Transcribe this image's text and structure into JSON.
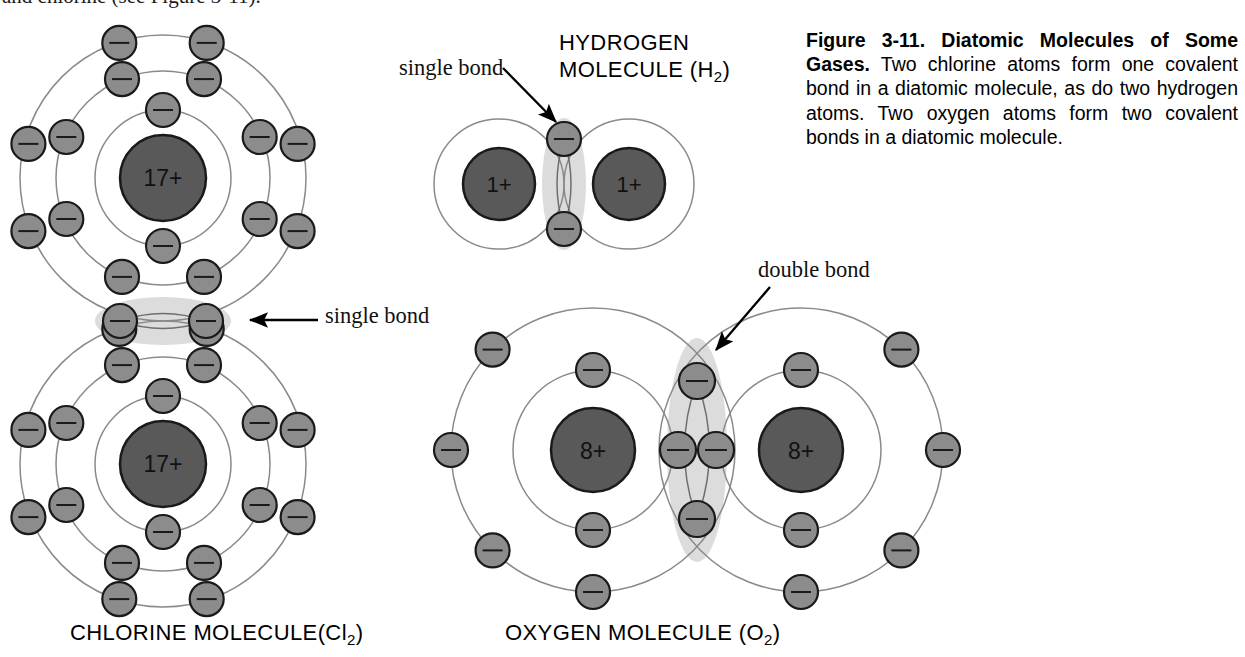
{
  "page": {
    "cropped_top_line": "and chlorine (see Figure 3-11).",
    "background": "#ffffff"
  },
  "caption": {
    "bold_lead": "Figure 3-11. Diatomic Molecules of Some Gases.",
    "body": " Two chlorine atoms form one covalent bond in a diatomic molecule, as do two hydrogen atoms. Two oxygen atoms form two covalent bonds in a diatomic molecule."
  },
  "colors": {
    "nucleus_fill": "#595959",
    "nucleus_stroke": "#1a1a1a",
    "electron_fill": "#8c8c8c",
    "electron_stroke": "#1a1a1a",
    "shell_stroke": "#8a8a8a",
    "bond_highlight": "#d9d9d9",
    "text": "#000000"
  },
  "molecules": [
    {
      "id": "chlorine",
      "title": "CHLORINE MOLECULE(Cl",
      "title_sub": "2",
      "title_tail": ")",
      "formula": "Cl2",
      "nucleus_label": "17+",
      "atom_count": 2,
      "orientation": "vertical",
      "shells": [
        2,
        8,
        7
      ],
      "bond_label": "single bond",
      "bond_type": "single",
      "shared_electrons": 2
    },
    {
      "id": "hydrogen",
      "title_line1": "HYDROGEN",
      "title_line2": "MOLECULE (H",
      "title_sub": "2",
      "title_tail": ")",
      "formula": "H2",
      "nucleus_label": "1+",
      "atom_count": 2,
      "orientation": "horizontal",
      "shells": [
        1
      ],
      "bond_label": "single bond",
      "bond_type": "single",
      "shared_electrons": 2
    },
    {
      "id": "oxygen",
      "title": "OXYGEN MOLECULE (O",
      "title_sub": "2",
      "title_tail": ")",
      "formula": "O2",
      "nucleus_label": "8+",
      "atom_count": 2,
      "orientation": "horizontal",
      "shells": [
        2,
        6
      ],
      "bond_label": "double bond",
      "bond_type": "double",
      "shared_electrons": 4
    }
  ],
  "electron_glyph": "−"
}
